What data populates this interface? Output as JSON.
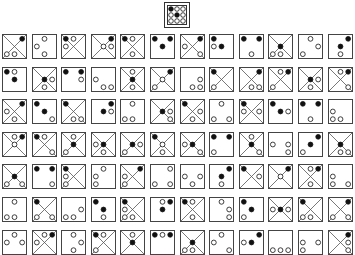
{
  "puzzle": {
    "target": {
      "x": false,
      "dots": [
        "f",
        "h",
        "h",
        "h",
        "f",
        "h",
        "h",
        "h",
        "h"
      ]
    },
    "legend": {
      "f": "filled dot",
      "h": "hollow dot",
      "s": "struck hollow dot",
      "-": "empty"
    },
    "rows": [
      [
        {
          "x": true,
          "dots": [
            "-",
            "-",
            "f",
            "-",
            "-",
            "-",
            "s",
            "h",
            "-"
          ]
        },
        {
          "x": false,
          "dots": [
            "-",
            "h",
            "-",
            "h",
            "-",
            "-",
            "-",
            "h",
            "-"
          ]
        },
        {
          "x": true,
          "dots": [
            "f",
            "h",
            "-",
            "h",
            "-",
            "-",
            "-",
            "-",
            "-"
          ]
        },
        {
          "x": true,
          "dots": [
            "-",
            "-",
            "f",
            "-",
            "h",
            "h",
            "-",
            "-",
            "-"
          ]
        },
        {
          "x": true,
          "dots": [
            "f",
            "h",
            "-",
            "-",
            "-",
            "-",
            "-",
            "h",
            "-"
          ]
        },
        {
          "x": false,
          "dots": [
            "f",
            "-",
            "f",
            "-",
            "f",
            "-",
            "-",
            "-",
            "-"
          ]
        },
        {
          "x": true,
          "dots": [
            "-",
            "-",
            "f",
            "h",
            "-",
            "-",
            "-",
            "-",
            "s"
          ]
        },
        {
          "x": false,
          "dots": [
            "f",
            "-",
            "-",
            "h",
            "f",
            "-",
            "-",
            "-",
            "-"
          ]
        },
        {
          "x": false,
          "dots": [
            "f",
            "-",
            "f",
            "-",
            "-",
            "-",
            "-",
            "h",
            "-"
          ]
        },
        {
          "x": true,
          "dots": [
            "-",
            "-",
            "-",
            "-",
            "f",
            "-",
            "s",
            "h",
            "-"
          ]
        },
        {
          "x": false,
          "dots": [
            "-",
            "h",
            "-",
            "-",
            "-",
            "h",
            "h",
            "-",
            "-"
          ]
        },
        {
          "x": false,
          "dots": [
            "-",
            "-",
            "f",
            "-",
            "f",
            "-",
            "-",
            "h",
            "-"
          ]
        }
      ],
      [
        {
          "x": false,
          "dots": [
            "f",
            "h",
            "-",
            "-",
            "f",
            "-",
            "-",
            "-",
            "-"
          ]
        },
        {
          "x": true,
          "dots": [
            "-",
            "-",
            "-",
            "-",
            "f",
            "h",
            "-",
            "h",
            "-"
          ]
        },
        {
          "x": false,
          "dots": [
            "f",
            "-",
            "f",
            "-",
            "-",
            "h",
            "-",
            "-",
            "-"
          ]
        },
        {
          "x": false,
          "dots": [
            "-",
            "-",
            "-",
            "h",
            "-",
            "-",
            "-",
            "h",
            "h"
          ]
        },
        {
          "x": true,
          "dots": [
            "-",
            "h",
            "-",
            "-",
            "f",
            "-",
            "-",
            "h",
            "-"
          ]
        },
        {
          "x": true,
          "dots": [
            "-",
            "-",
            "f",
            "-",
            "h",
            "-",
            "h",
            "-",
            "-"
          ]
        },
        {
          "x": false,
          "dots": [
            "-",
            "-",
            "-",
            "-",
            "-",
            "h",
            "-",
            "h",
            "h"
          ]
        },
        {
          "x": true,
          "dots": [
            "f",
            "-",
            "-",
            "-",
            "-",
            "-",
            "s",
            "-",
            "-"
          ]
        },
        {
          "x": true,
          "dots": [
            "-",
            "-",
            "f",
            "-",
            "-",
            "-",
            "-",
            "h",
            "h"
          ]
        },
        {
          "x": true,
          "dots": [
            "-",
            "h",
            "f",
            "-",
            "-",
            "-",
            "s",
            "-",
            "-"
          ]
        },
        {
          "x": true,
          "dots": [
            "-",
            "-",
            "-",
            "-",
            "f",
            "h",
            "-",
            "h",
            "-"
          ]
        },
        {
          "x": true,
          "dots": [
            "-",
            "h",
            "f",
            "-",
            "-",
            "-",
            "-",
            "-",
            "s"
          ]
        }
      ],
      [
        {
          "x": true,
          "dots": [
            "-",
            "-",
            "f",
            "h",
            "-",
            "-",
            "-",
            "h",
            "-"
          ]
        },
        {
          "x": false,
          "dots": [
            "f",
            "-",
            "-",
            "-",
            "f",
            "-",
            "-",
            "-",
            "h"
          ]
        },
        {
          "x": true,
          "dots": [
            "f",
            "-",
            "-",
            "-",
            "-",
            "-",
            "-",
            "h",
            "s"
          ]
        },
        {
          "x": false,
          "dots": [
            "-",
            "-",
            "f",
            "-",
            "f",
            "h",
            "-",
            "-",
            "-"
          ]
        },
        {
          "x": false,
          "dots": [
            "-",
            "h",
            "-",
            "-",
            "-",
            "-",
            "h",
            "h",
            "-"
          ]
        },
        {
          "x": true,
          "dots": [
            "-",
            "-",
            "-",
            "-",
            "f",
            "h",
            "-",
            "-",
            "s"
          ]
        },
        {
          "x": true,
          "dots": [
            "f",
            "-",
            "-",
            "-",
            "-",
            "h",
            "-",
            "h",
            "-"
          ]
        },
        {
          "x": false,
          "dots": [
            "-",
            "h",
            "-",
            "-",
            "-",
            "-",
            "h",
            "-",
            "h"
          ]
        },
        {
          "x": true,
          "dots": [
            "f",
            "-",
            "-",
            "h",
            "-",
            "h",
            "-",
            "-",
            "-"
          ]
        },
        {
          "x": false,
          "dots": [
            "f",
            "-",
            "-",
            "-",
            "f",
            "h",
            "-",
            "-",
            "-"
          ]
        },
        {
          "x": false,
          "dots": [
            "f",
            "-",
            "f",
            "-",
            "-",
            "-",
            "-",
            "h",
            "-"
          ]
        },
        {
          "x": false,
          "dots": [
            "-",
            "-",
            "-",
            "h",
            "-",
            "-",
            "h",
            "h",
            "-"
          ]
        }
      ],
      [
        {
          "x": true,
          "dots": [
            "-",
            "h",
            "f",
            "-",
            "h",
            "-",
            "-",
            "-",
            "-"
          ]
        },
        {
          "x": true,
          "dots": [
            "f",
            "h",
            "-",
            "-",
            "-",
            "-",
            "-",
            "-",
            "s"
          ]
        },
        {
          "x": true,
          "dots": [
            "-",
            "h",
            "-",
            "-",
            "f",
            "-",
            "s",
            "-",
            "-"
          ]
        },
        {
          "x": true,
          "dots": [
            "-",
            "-",
            "-",
            "h",
            "f",
            "-",
            "-",
            "h",
            "-"
          ]
        },
        {
          "x": true,
          "dots": [
            "-",
            "-",
            "-",
            "-",
            "f",
            "h",
            "s",
            "-",
            "-"
          ]
        },
        {
          "x": true,
          "dots": [
            "f",
            "-",
            "-",
            "-",
            "h",
            "-",
            "-",
            "h",
            "-"
          ]
        },
        {
          "x": true,
          "dots": [
            "-",
            "-",
            "-",
            "h",
            "f",
            "-",
            "-",
            "-",
            "s"
          ]
        },
        {
          "x": false,
          "dots": [
            "f",
            "-",
            "f",
            "-",
            "-",
            "-",
            "h",
            "-",
            "-"
          ]
        },
        {
          "x": true,
          "dots": [
            "-",
            "h",
            "-",
            "-",
            "f",
            "-",
            "-",
            "-",
            "s"
          ]
        },
        {
          "x": false,
          "dots": [
            "-",
            "-",
            "-",
            "h",
            "-",
            "h",
            "-",
            "-",
            "h"
          ]
        },
        {
          "x": false,
          "dots": [
            "-",
            "-",
            "f",
            "-",
            "f",
            "-",
            "h",
            "-",
            "-"
          ]
        },
        {
          "x": true,
          "dots": [
            "-",
            "-",
            "-",
            "-",
            "f",
            "-",
            "-",
            "h",
            "h"
          ]
        }
      ],
      [
        {
          "x": true,
          "dots": [
            "-",
            "-",
            "-",
            "-",
            "f",
            "-",
            "s",
            "-",
            "s"
          ]
        },
        {
          "x": false,
          "dots": [
            "f",
            "-",
            "f",
            "-",
            "-",
            "-",
            "-",
            "-",
            "h"
          ]
        },
        {
          "x": true,
          "dots": [
            "f",
            "-",
            "-",
            "h",
            "-",
            "-",
            "s",
            "-",
            "-"
          ]
        },
        {
          "x": false,
          "dots": [
            "-",
            "h",
            "-",
            "h",
            "-",
            "-",
            "h",
            "-",
            "-"
          ]
        },
        {
          "x": true,
          "dots": [
            "-",
            "-",
            "f",
            "h",
            "-",
            "-",
            "s",
            "-",
            "-"
          ]
        },
        {
          "x": false,
          "dots": [
            "-",
            "-",
            "h",
            "-",
            "-",
            "-",
            "h",
            "-",
            "h"
          ]
        },
        {
          "x": false,
          "dots": [
            "-",
            "-",
            "-",
            "h",
            "-",
            "h",
            "-",
            "h",
            "-"
          ]
        },
        {
          "x": false,
          "dots": [
            "-",
            "-",
            "f",
            "-",
            "f",
            "-",
            "-",
            "h",
            "-"
          ]
        },
        {
          "x": true,
          "dots": [
            "f",
            "-",
            "-",
            "-",
            "-",
            "h",
            "-",
            "-",
            "-"
          ]
        },
        {
          "x": true,
          "dots": [
            "-",
            "-",
            "f",
            "-",
            "h",
            "-",
            "-",
            "-",
            "-"
          ]
        },
        {
          "x": true,
          "dots": [
            "-",
            "h",
            "f",
            "-",
            "-",
            "-",
            "-",
            "h",
            "-"
          ]
        },
        {
          "x": false,
          "dots": [
            "-",
            "-",
            "-",
            "h",
            "-",
            "-",
            "h",
            "-",
            "h"
          ]
        }
      ],
      [
        {
          "x": false,
          "dots": [
            "-",
            "h",
            "-",
            "-",
            "-",
            "-",
            "h",
            "h",
            "-"
          ]
        },
        {
          "x": true,
          "dots": [
            "f",
            "-",
            "-",
            "-",
            "-",
            "-",
            "s",
            "-",
            "s"
          ]
        },
        {
          "x": false,
          "dots": [
            "-",
            "-",
            "-",
            "-",
            "-",
            "h",
            "h",
            "h",
            "-"
          ]
        },
        {
          "x": false,
          "dots": [
            "f",
            "-",
            "-",
            "-",
            "f",
            "-",
            "-",
            "h",
            "-"
          ]
        },
        {
          "x": true,
          "dots": [
            "f",
            "-",
            "-",
            "h",
            "-",
            "-",
            "s",
            "h",
            "-"
          ]
        },
        {
          "x": false,
          "dots": [
            "-",
            "h",
            "f",
            "-",
            "f",
            "-",
            "-",
            "-",
            "-"
          ]
        },
        {
          "x": true,
          "dots": [
            "f",
            "h",
            "-",
            "-",
            "-",
            "-",
            "-",
            "h",
            "-"
          ]
        },
        {
          "x": false,
          "dots": [
            "-",
            "h",
            "-",
            "-",
            "-",
            "h",
            "-",
            "-",
            "h"
          ]
        },
        {
          "x": false,
          "dots": [
            "f",
            "-",
            "-",
            "-",
            "f",
            "-",
            "h",
            "-",
            "-"
          ]
        },
        {
          "x": true,
          "dots": [
            "-",
            "-",
            "-",
            "h",
            "f",
            "h",
            "-",
            "-",
            "-"
          ]
        },
        {
          "x": true,
          "dots": [
            "f",
            "-",
            "-",
            "-",
            "-",
            "-",
            "s",
            "h",
            "-"
          ]
        },
        {
          "x": true,
          "dots": [
            "-",
            "-",
            "f",
            "-",
            "-",
            "-",
            "s",
            "-",
            "s"
          ]
        }
      ],
      [
        {
          "x": false,
          "dots": [
            "-",
            "h",
            "-",
            "h",
            "-",
            "h",
            "-",
            "-",
            "-"
          ]
        },
        {
          "x": true,
          "dots": [
            "-",
            "h",
            "f",
            "h",
            "-",
            "-",
            "-",
            "-",
            "-"
          ]
        },
        {
          "x": false,
          "dots": [
            "-",
            "h",
            "-",
            "-",
            "-",
            "h",
            "-",
            "h",
            "-"
          ]
        },
        {
          "x": true,
          "dots": [
            "f",
            "h",
            "-",
            "-",
            "-",
            "-",
            "s",
            "-",
            "-"
          ]
        },
        {
          "x": true,
          "dots": [
            "-",
            "h",
            "-",
            "-",
            "f",
            "-",
            "-",
            "-",
            "-"
          ]
        },
        {
          "x": false,
          "dots": [
            "f",
            "h",
            "f",
            "-",
            "-",
            "-",
            "-",
            "-",
            "-"
          ]
        },
        {
          "x": true,
          "dots": [
            "-",
            "-",
            "-",
            "-",
            "f",
            "-",
            "s",
            "h",
            "-"
          ]
        },
        {
          "x": false,
          "dots": [
            "-",
            "h",
            "-",
            "h",
            "-",
            "-",
            "-",
            "-",
            "h"
          ]
        },
        {
          "x": false,
          "dots": [
            "-",
            "-",
            "f",
            "h",
            "f",
            "-",
            "-",
            "-",
            "-"
          ]
        },
        {
          "x": false,
          "dots": [
            "-",
            "-",
            "-",
            "-",
            "-",
            "-",
            "h",
            "h",
            "h"
          ]
        },
        {
          "x": false,
          "dots": [
            "-",
            "-",
            "-",
            "h",
            "-",
            "h",
            "h",
            "-",
            "-"
          ]
        },
        {
          "x": true,
          "dots": [
            "-",
            "-",
            "f",
            "-",
            "-",
            "h",
            "-",
            "-",
            "s"
          ]
        }
      ]
    ]
  }
}
